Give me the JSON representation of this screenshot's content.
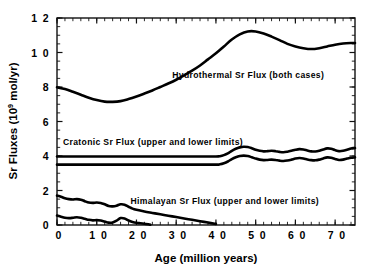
{
  "chart_data": {
    "type": "line",
    "title": "",
    "xlabel": "Age (million years)",
    "ylabel": "Sr Fluxes (10⁹ mol/yr)",
    "ylabel_main": "Sr Fluxes (10",
    "ylabel_exp": "9",
    "ylabel_tail": " mol/yr)",
    "xlabel_main": "Age",
    "xlabel_paren": "(million years)",
    "xlim": [
      0,
      75
    ],
    "ylim": [
      0,
      12
    ],
    "xticks": [
      0,
      10,
      20,
      30,
      40,
      50,
      60,
      70
    ],
    "xtick_labels": [
      "0",
      "1 0",
      "2 0",
      "3 0",
      "4 0",
      "5 0",
      "6 0",
      "7 0"
    ],
    "yticks": [
      0,
      2,
      4,
      6,
      8,
      10,
      12
    ],
    "ytick_labels": [
      "0",
      "2",
      "4",
      "6",
      "8",
      "1 0",
      "1 2"
    ],
    "x_minor_step": 2,
    "y_minor_step": 0.5,
    "grid": false,
    "legend_position": "inline-annotations",
    "frame": "box",
    "line_color": "#000000",
    "background_color": "#ffffff",
    "annotations": [
      {
        "name": "hydrothermal-label",
        "text": "Hydrothermal Sr Flux (both cases)",
        "x": 29.0,
        "y": 8.55
      },
      {
        "name": "cratonic-label",
        "text": "Cratonic Sr Flux (upper and lower limits)",
        "x": 1.5,
        "y": 4.62
      },
      {
        "name": "himalayan-label",
        "text": "Himalayan Sr Flux (upper and lower limits)",
        "x": 18.5,
        "y": 1.22
      }
    ],
    "series": [
      {
        "name": "Hydrothermal Sr Flux (both cases)",
        "x": [
          0,
          2,
          4,
          6,
          8,
          10,
          12,
          14,
          16,
          18,
          20,
          22,
          24,
          26,
          28,
          30,
          32,
          34,
          36,
          38,
          40,
          42,
          44,
          46,
          48,
          50,
          52,
          54,
          56,
          58,
          60,
          62,
          64,
          66,
          68,
          70,
          72,
          74,
          75
        ],
        "values": [
          7.98,
          7.88,
          7.72,
          7.55,
          7.38,
          7.24,
          7.15,
          7.14,
          7.18,
          7.3,
          7.45,
          7.62,
          7.8,
          8.0,
          8.2,
          8.42,
          8.68,
          8.95,
          9.25,
          9.6,
          9.95,
          10.35,
          10.75,
          11.05,
          11.22,
          11.22,
          11.1,
          10.92,
          10.72,
          10.5,
          10.35,
          10.25,
          10.2,
          10.25,
          10.35,
          10.45,
          10.52,
          10.55,
          10.55
        ]
      },
      {
        "name": "Cratonic Sr Flux (upper limit)",
        "x": [
          0,
          5,
          10,
          15,
          20,
          25,
          30,
          35,
          40,
          41,
          42,
          43,
          44,
          45,
          46,
          47,
          48,
          49,
          50,
          51,
          52,
          53,
          54,
          55,
          56,
          57,
          58,
          59,
          60,
          61,
          62,
          63,
          64,
          65,
          66,
          67,
          68,
          69,
          70,
          71,
          72,
          73,
          74,
          75
        ],
        "values": [
          3.97,
          3.97,
          3.97,
          3.97,
          3.97,
          3.97,
          3.97,
          3.97,
          3.97,
          3.99,
          4.05,
          4.15,
          4.3,
          4.42,
          4.5,
          4.54,
          4.52,
          4.45,
          4.36,
          4.3,
          4.27,
          4.28,
          4.3,
          4.28,
          4.24,
          4.22,
          4.25,
          4.3,
          4.36,
          4.4,
          4.38,
          4.32,
          4.27,
          4.26,
          4.3,
          4.38,
          4.44,
          4.42,
          4.34,
          4.28,
          4.3,
          4.36,
          4.43,
          4.46
        ]
      },
      {
        "name": "Cratonic Sr Flux (lower limit)",
        "x": [
          0,
          5,
          10,
          15,
          20,
          25,
          30,
          35,
          40,
          41,
          42,
          43,
          44,
          45,
          46,
          47,
          48,
          49,
          50,
          51,
          52,
          53,
          54,
          55,
          56,
          57,
          58,
          59,
          60,
          61,
          62,
          63,
          64,
          65,
          66,
          67,
          68,
          69,
          70,
          71,
          72,
          73,
          74,
          75
        ],
        "values": [
          3.5,
          3.5,
          3.5,
          3.5,
          3.5,
          3.5,
          3.5,
          3.5,
          3.5,
          3.52,
          3.58,
          3.68,
          3.82,
          3.93,
          4.0,
          4.02,
          4.0,
          3.93,
          3.85,
          3.79,
          3.76,
          3.77,
          3.79,
          3.77,
          3.73,
          3.71,
          3.74,
          3.79,
          3.85,
          3.88,
          3.86,
          3.8,
          3.76,
          3.75,
          3.79,
          3.86,
          3.92,
          3.9,
          3.83,
          3.77,
          3.79,
          3.85,
          3.9,
          3.92
        ]
      },
      {
        "name": "Himalayan Sr Flux (upper limit)",
        "x": [
          0,
          1,
          2,
          3,
          4,
          5,
          6,
          7,
          8,
          9,
          10,
          11,
          12,
          13,
          14,
          15,
          16,
          17,
          18,
          19,
          20,
          22,
          24,
          26,
          28,
          30,
          32,
          34,
          36,
          38,
          40
        ],
        "values": [
          1.7,
          1.64,
          1.55,
          1.5,
          1.48,
          1.5,
          1.47,
          1.38,
          1.3,
          1.28,
          1.3,
          1.28,
          1.2,
          1.1,
          1.08,
          1.12,
          1.2,
          1.18,
          1.06,
          0.95,
          0.88,
          0.78,
          0.7,
          0.62,
          0.54,
          0.46,
          0.38,
          0.3,
          0.22,
          0.14,
          0.06
        ]
      },
      {
        "name": "Himalayan Sr Flux (lower limit)",
        "x": [
          0,
          1,
          2,
          3,
          4,
          5,
          6,
          7,
          8,
          9,
          10,
          11,
          12,
          13,
          14,
          15,
          16,
          17,
          18,
          19,
          20,
          21,
          22,
          23,
          23.5
        ],
        "values": [
          0.55,
          0.48,
          0.42,
          0.4,
          0.42,
          0.45,
          0.42,
          0.36,
          0.3,
          0.27,
          0.28,
          0.26,
          0.2,
          0.14,
          0.15,
          0.25,
          0.4,
          0.38,
          0.26,
          0.18,
          0.13,
          0.1,
          0.07,
          0.04,
          0.02
        ]
      }
    ]
  }
}
